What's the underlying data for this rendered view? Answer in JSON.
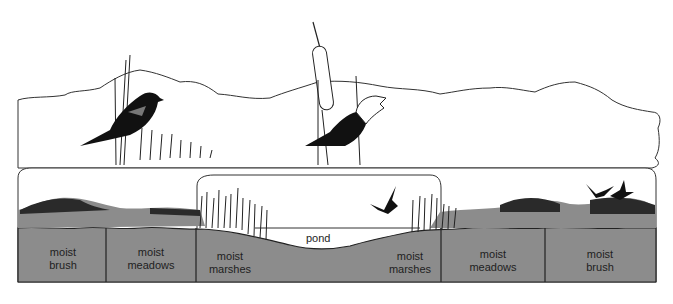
{
  "diagram": {
    "colors": {
      "soil": "#8c8c8c",
      "vegetation": "#2a2a2a",
      "outline": "#333333",
      "background": "#ffffff"
    },
    "zones": [
      {
        "label_line1": "moist",
        "label_line2": "brush"
      },
      {
        "label_line1": "moist",
        "label_line2": "meadows"
      },
      {
        "label_line1": "moist",
        "label_line2": "marshes"
      },
      {
        "label_line1": "moist",
        "label_line2": "marshes"
      },
      {
        "label_line1": "moist",
        "label_line2": "meadows"
      },
      {
        "label_line1": "moist",
        "label_line2": "brush"
      }
    ],
    "pond_label": "pond",
    "birds": [
      {
        "name": "red-winged blackbird",
        "position": "upper-left"
      },
      {
        "name": "yellow-headed blackbird",
        "position": "upper-center"
      },
      {
        "name": "flying bird",
        "position": "over pond"
      },
      {
        "name": "flying birds pair",
        "position": "over right brush"
      }
    ]
  }
}
